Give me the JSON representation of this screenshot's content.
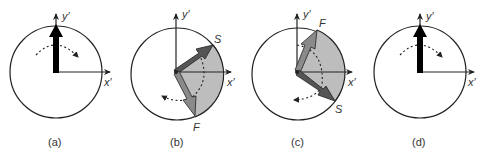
{
  "figure": {
    "panels": [
      {
        "id": "a",
        "caption": "(a)",
        "x_axis_label": "x′",
        "y_axis_label": "y′",
        "vectors": [
          {
            "name": "",
            "direction": "up"
          }
        ]
      },
      {
        "id": "b",
        "caption": "(b)",
        "x_axis_label": "x′",
        "y_axis_label": "y′",
        "vectors": [
          {
            "name": "S",
            "direction": "upper-right"
          },
          {
            "name": "F",
            "direction": "lower-right"
          }
        ]
      },
      {
        "id": "c",
        "caption": "(c)",
        "x_axis_label": "x′",
        "y_axis_label": "y′",
        "vectors": [
          {
            "name": "F",
            "direction": "upper-right"
          },
          {
            "name": "S",
            "direction": "lower-right"
          }
        ]
      },
      {
        "id": "d",
        "caption": "(d)",
        "x_axis_label": "x′",
        "y_axis_label": "y′",
        "vectors": [
          {
            "name": "",
            "direction": "up"
          }
        ]
      }
    ],
    "colors": {
      "stroke": "#222222",
      "fill_sector": "#bdbdbd",
      "vector_dark": "#555555",
      "vector_mid": "#8a8a8a",
      "vector_black": "#000000"
    }
  }
}
